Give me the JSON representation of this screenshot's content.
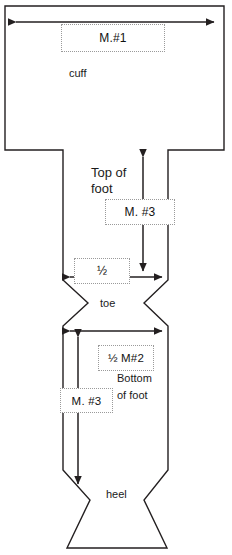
{
  "diagram": {
    "width": 232,
    "height": 555,
    "stroke_color": "#231f20",
    "callout_border_color": "#9a9a9a",
    "background": "#ffffff"
  },
  "parts": {
    "cuff": "cuff",
    "top_of_foot_line1": "Top of",
    "top_of_foot_line2": "foot",
    "toe": "toe",
    "bottom_of_foot_line1": "Bottom",
    "bottom_of_foot_line2": "of foot",
    "heel": "heel"
  },
  "callouts": {
    "cuff_width": "M.#1",
    "top_of_foot_length": "M. #3",
    "toe_width_half": "½",
    "bottom_half_m2": "½ M#2",
    "bottom_of_foot_length": "M. #3"
  },
  "arrows": {
    "cuff_width_arrow": "double-headed-horizontal",
    "top_of_foot_arrow": "double-headed-vertical",
    "toe_width_arrow": "double-headed-horizontal",
    "bottom_width_arrow": "double-headed-horizontal",
    "bottom_of_foot_arrow": "double-headed-vertical"
  }
}
